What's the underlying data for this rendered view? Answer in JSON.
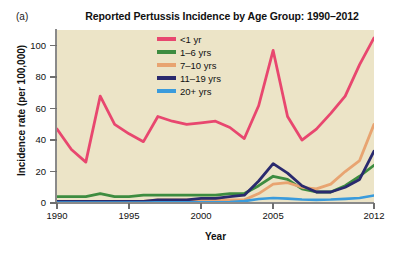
{
  "panel": {
    "label": "(a)"
  },
  "chart_data": {
    "type": "line",
    "title": "Reported Pertussis Incidence by Age Group: 1990–2012",
    "xlabel": "Year",
    "ylabel": "Incidence rate (per 100,000)",
    "xlim": [
      1990,
      2012
    ],
    "ylim": [
      0,
      110
    ],
    "grid": false,
    "legend_position": "top-center-inside",
    "x": [
      1990,
      1991,
      1992,
      1993,
      1994,
      1995,
      1996,
      1997,
      1998,
      1999,
      2000,
      2001,
      2002,
      2003,
      2004,
      2005,
      2006,
      2007,
      2008,
      2009,
      2010,
      2011,
      2012
    ],
    "xticks": [
      1990,
      1995,
      2000,
      2005,
      2012
    ],
    "xtick_labels": [
      "1990",
      "1995",
      "2000",
      "2005",
      "2012"
    ],
    "yticks": [
      0,
      20,
      40,
      60,
      80,
      100
    ],
    "ytick_labels": [
      "0",
      "20",
      "40",
      "60",
      "80",
      "100"
    ],
    "series": [
      {
        "name": "<1 yr",
        "color": "#e8476f",
        "values": [
          47,
          34,
          26,
          68,
          50,
          44,
          39,
          55,
          52,
          50,
          51,
          52,
          48,
          41,
          62,
          97,
          55,
          40,
          47,
          57,
          68,
          88,
          105
        ]
      },
      {
        "name": "1–6 yrs",
        "color": "#3d8c40",
        "values": [
          4,
          4,
          4,
          6,
          4,
          4,
          5,
          5,
          5,
          5,
          5,
          5,
          6,
          6,
          11,
          17,
          15,
          9,
          7,
          7,
          11,
          17,
          24
        ]
      },
      {
        "name": "7–10 yrs",
        "color": "#e8a471",
        "values": [
          1,
          1,
          1,
          1,
          1,
          1,
          1,
          2,
          2,
          2,
          2,
          2,
          2,
          2,
          6,
          12,
          13,
          10,
          9,
          12,
          20,
          27,
          50
        ]
      },
      {
        "name": "11–19 yrs",
        "color": "#2a2a6e",
        "values": [
          1,
          1,
          1,
          1,
          1,
          1,
          1,
          2,
          2,
          2,
          3,
          3,
          4,
          5,
          14,
          25,
          19,
          11,
          7,
          7,
          10,
          15,
          33
        ]
      },
      {
        "name": "20+ yrs",
        "color": "#3a9bdc",
        "values": [
          0.3,
          0.3,
          0.3,
          0.3,
          0.3,
          0.3,
          0.3,
          0.4,
          0.4,
          0.4,
          0.5,
          0.5,
          0.6,
          1.2,
          2.5,
          3.2,
          2.8,
          2.2,
          2.0,
          2.2,
          2.6,
          3.2,
          4.8
        ]
      }
    ],
    "plot_background": "#ece4c7",
    "axis_color": "#8a8a8a"
  }
}
